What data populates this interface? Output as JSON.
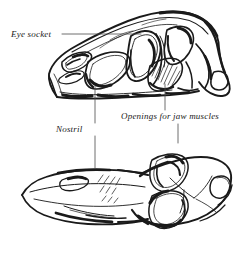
{
  "figure": {
    "background_color": "#ffffff",
    "ink_color": "#1a1a1a",
    "width": 236,
    "height": 257
  },
  "labels": {
    "eye_socket": "Eye socket",
    "nostril": "Nostril",
    "jaw_muscles": "Openings for jaw muscles"
  },
  "leaders": [
    {
      "name": "eye-socket-leader",
      "label": "Eye socket",
      "type": "horizontal",
      "from": [
        62,
        34
      ],
      "to": [
        141,
        34
      ]
    },
    {
      "name": "nostril-leader",
      "label": "Nostril",
      "type": "vertical",
      "from": [
        95,
        86
      ],
      "to": [
        95,
        123
      ]
    },
    {
      "name": "nostril-leader-lower",
      "label": "Nostril",
      "type": "vertical",
      "from": [
        95,
        136
      ],
      "to": [
        95,
        168
      ]
    },
    {
      "name": "jaw-muscles-leader",
      "label": "Openings for jaw muscles",
      "type": "vertical",
      "from": [
        165,
        84
      ],
      "to": [
        165,
        110
      ]
    },
    {
      "name": "jaw-muscles-leader-lower",
      "label": "Openings for jaw muscles",
      "type": "vertical",
      "from": [
        178,
        124
      ],
      "to": [
        178,
        143
      ]
    }
  ],
  "views": [
    {
      "name": "lateral-skull-view",
      "orientation": "lateral",
      "bounds": [
        46,
        10,
        236,
        105
      ],
      "features": [
        "snout",
        "nostril",
        "eye socket",
        "antorbital fenestra",
        "jaw muscle openings",
        "tooth row",
        "quadrate"
      ]
    },
    {
      "name": "dorsal-skull-view",
      "orientation": "dorsal",
      "bounds": [
        20,
        140,
        236,
        250
      ],
      "features": [
        "snout",
        "nostril",
        "orbits",
        "temporal openings",
        "quadrate condyles"
      ]
    }
  ]
}
